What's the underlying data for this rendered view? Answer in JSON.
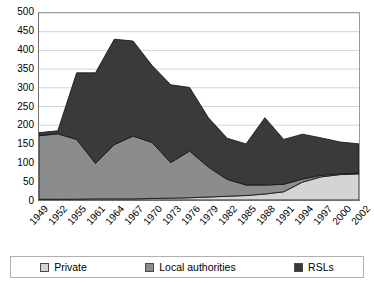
{
  "chart_data": {
    "type": "area",
    "stacked": true,
    "title": "",
    "xlabel": "",
    "ylabel": "",
    "ylim": [
      0,
      500
    ],
    "ytick_step": 50,
    "yticks": [
      500,
      450,
      400,
      350,
      300,
      250,
      200,
      150,
      100,
      50,
      0
    ],
    "grid": true,
    "legend_position": "bottom",
    "categories": [
      "1949",
      "1952",
      "1955",
      "1961",
      "1964",
      "1967",
      "1970",
      "1973",
      "1976",
      "1979",
      "1982",
      "1985",
      "1988",
      "1991",
      "1994",
      "1997",
      "2000",
      "2002"
    ],
    "series": [
      {
        "name": "Private",
        "color": "#d4d4d4",
        "values": [
          2,
          2,
          2,
          3,
          3,
          3,
          4,
          5,
          6,
          8,
          10,
          12,
          16,
          22,
          48,
          62,
          68,
          70
        ]
      },
      {
        "name": "Local authorities",
        "color": "#8c8c8c",
        "values": [
          170,
          175,
          160,
          95,
          145,
          168,
          150,
          95,
          125,
          80,
          45,
          28,
          24,
          20,
          8,
          4,
          2,
          2
        ]
      },
      {
        "name": "RSLs",
        "color": "#3a3a3a",
        "values": [
          8,
          8,
          178,
          242,
          282,
          254,
          206,
          208,
          170,
          132,
          110,
          110,
          180,
          120,
          120,
          100,
          85,
          78
        ]
      }
    ],
    "totals": [
      180,
      185,
      340,
      340,
      430,
      425,
      360,
      308,
      301,
      220,
      165,
      150,
      220,
      162,
      176,
      166,
      155,
      150
    ]
  },
  "legend": {
    "items": [
      {
        "label": "Private",
        "color": "#d4d4d4"
      },
      {
        "label": "Local authorities",
        "color": "#8c8c8c"
      },
      {
        "label": "RSLs",
        "color": "#3a3a3a"
      }
    ]
  }
}
